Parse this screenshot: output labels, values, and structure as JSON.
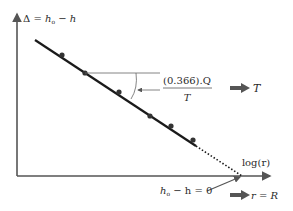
{
  "diagram": {
    "y_axis_label": {
      "prefix": "Δ = ",
      "h0": "h",
      "sub0": "o",
      "minus": " − ",
      "h": "h"
    },
    "x_axis_label": "log(r)",
    "slope_label": {
      "numerator": "(0.366).Q",
      "denominator": "T"
    },
    "result_T": "T",
    "intercept_label": {
      "h0": "h",
      "sub0": "o",
      "rest": " − h = 0"
    },
    "result_R": "r = R",
    "colors": {
      "line": "#1a1a1a",
      "axis": "#555555",
      "arrow": "#555555",
      "point": "#333333"
    },
    "points": [
      {
        "x": 62,
        "y": 55
      },
      {
        "x": 85,
        "y": 73
      },
      {
        "x": 119,
        "y": 92
      },
      {
        "x": 150,
        "y": 116
      },
      {
        "x": 171,
        "y": 126
      },
      {
        "x": 193,
        "y": 140
      }
    ]
  }
}
